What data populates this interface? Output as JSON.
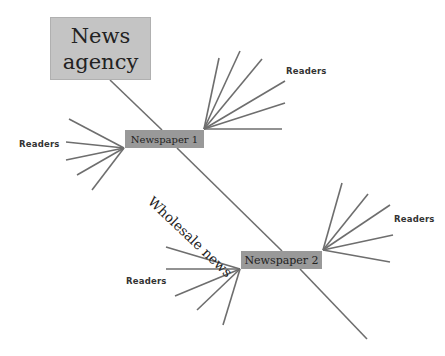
{
  "diagram": {
    "nodes": {
      "agency": {
        "line1": "News",
        "line2": "agency"
      },
      "newspaper1": {
        "label": "Newspaper 1"
      },
      "newspaper2": {
        "label": "Newspaper 2"
      }
    },
    "edge_labels": {
      "wholesale": "Wholesale news"
    },
    "readers_labels": [
      "Readers",
      "Readers",
      "Readers",
      "Readers"
    ],
    "colors": {
      "line": "#6e6e6e",
      "agency_box": "#c4c4c4",
      "newspaper_box": "#999999",
      "background": "#ffffff"
    },
    "lines": {
      "agency_to_np1": [
        110,
        80,
        162,
        130
      ],
      "wholesale": [
        177,
        148,
        282,
        251
      ],
      "np2_tail": [
        300,
        269,
        367,
        339
      ],
      "np1_left_origin": [
        124,
        148
      ],
      "np1_left_fan": [
        [
          69,
          119
        ],
        [
          66,
          142
        ],
        [
          66,
          160
        ],
        [
          77,
          175
        ],
        [
          92,
          190
        ]
      ],
      "np1_right_origin": [
        204,
        129
      ],
      "np1_right_fan": [
        [
          219,
          58
        ],
        [
          240,
          51
        ],
        [
          262,
          59
        ],
        [
          285,
          81
        ],
        [
          285,
          103
        ],
        [
          282,
          129
        ]
      ],
      "np2_left_origin": [
        240,
        269
      ],
      "np2_left_fan": [
        [
          166,
          247
        ],
        [
          166,
          269
        ],
        [
          175,
          296
        ],
        [
          197,
          310
        ],
        [
          223,
          325
        ]
      ],
      "np2_right_origin": [
        323,
        250
      ],
      "np2_right_fan": [
        [
          342,
          183
        ],
        [
          368,
          194
        ],
        [
          390,
          205
        ],
        [
          393,
          235
        ],
        [
          390,
          262
        ]
      ]
    }
  }
}
